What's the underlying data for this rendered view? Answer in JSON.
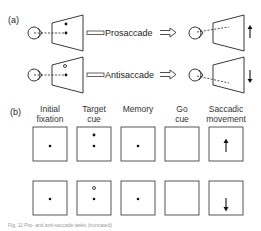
{
  "panel_a": {
    "label": "(a)",
    "rows": [
      {
        "task": "Prosaccade",
        "target": "filled",
        "movement": "up"
      },
      {
        "task": "Antisaccade",
        "target": "open",
        "movement": "down"
      }
    ]
  },
  "panel_b": {
    "label": "(b)",
    "headers": [
      {
        "line1": "Initial",
        "line2": "fixation"
      },
      {
        "line1": "Target",
        "line2": "cue"
      },
      {
        "line1": "Memory",
        "line2": ""
      },
      {
        "line1": "Go",
        "line2": "cue"
      },
      {
        "line1": "Saccadic",
        "line2": "movement"
      }
    ],
    "rows": [
      {
        "cue_type": "filled",
        "movement": "up"
      },
      {
        "cue_type": "open",
        "movement": "down"
      }
    ]
  },
  "caption": "Fig. 11 Pro- and anti-saccade tasks (truncated)",
  "colors": {
    "ink": "#222222",
    "box": "#444444"
  }
}
